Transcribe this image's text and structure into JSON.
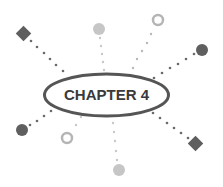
{
  "title": "CHAPTER 4",
  "colors": {
    "dark": "#5f5f5f",
    "light": "#c6c6c6",
    "ellipse_stroke": "#555555",
    "text": "#3a3a3a"
  },
  "nodes": [
    {
      "name": "diamond-top-left",
      "shape": "diamond",
      "tone": "dark"
    },
    {
      "name": "circle-top",
      "shape": "circle",
      "tone": "light"
    },
    {
      "name": "ring-top-right",
      "shape": "ring",
      "tone": "light"
    },
    {
      "name": "circle-right",
      "shape": "circle",
      "tone": "dark"
    },
    {
      "name": "diamond-bottom-right",
      "shape": "diamond",
      "tone": "dark"
    },
    {
      "name": "circle-bottom",
      "shape": "circle",
      "tone": "light"
    },
    {
      "name": "ring-bottom-left",
      "shape": "ring",
      "tone": "light"
    },
    {
      "name": "circle-left",
      "shape": "circle",
      "tone": "dark"
    }
  ]
}
